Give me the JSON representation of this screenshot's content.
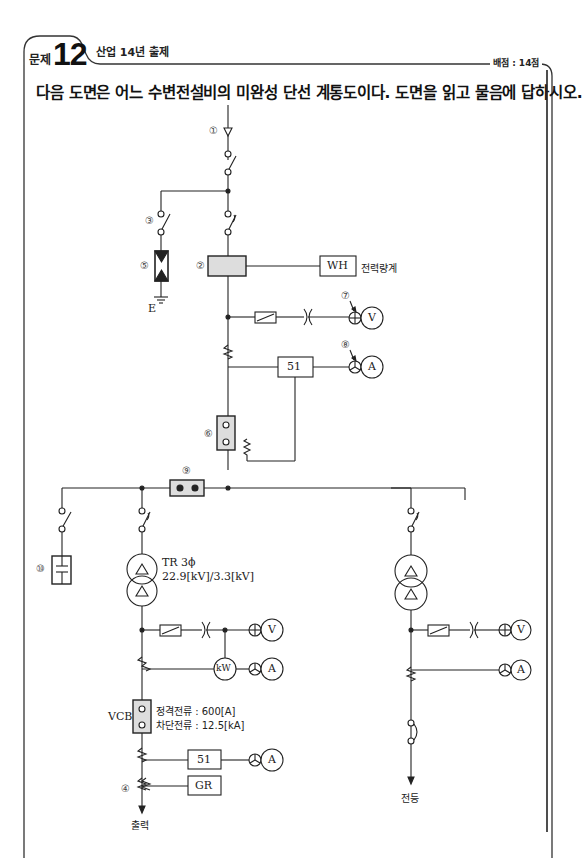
{
  "header": {
    "problem_label": "문제",
    "problem_number": "12",
    "source": "산업 14년 출제",
    "score": "배점 : 14점"
  },
  "question": "다음 도면은 어느 수변전설비의 미완성 단선 계통도이다. 도면을 읽고 물음에 답하시오.",
  "diagram": {
    "type": "single-line-diagram",
    "markers": {
      "m1": "①",
      "m2": "②",
      "m3": "③",
      "m4": "④",
      "m5": "⑤",
      "m6": "⑥",
      "m7": "⑦",
      "m8": "⑧",
      "m9": "⑨",
      "m10": "⑩"
    },
    "labels": {
      "wh": "WH",
      "wh_desc": "전력량계",
      "ground": "E",
      "relay_51_top": "51",
      "voltmeter": "V",
      "ammeter": "A",
      "tr_name": "TR 3ϕ",
      "tr_ratio": "22.9[kV]/3.3[kV]",
      "kw": "kW",
      "vcb": "VCB",
      "vcb_rated": "정격전류 : 600[A]",
      "vcb_break": "차단전류 : 12.5[kA]",
      "relay_51_bottom": "51",
      "gr": "GR",
      "out_left": "출력",
      "out_right": "전등"
    }
  }
}
